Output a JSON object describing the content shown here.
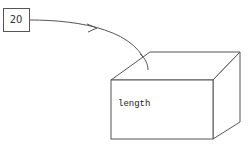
{
  "value_box": {
    "value": "20"
  },
  "variable_box": {
    "name": "length"
  },
  "colors": {
    "stroke": "#555555",
    "background": "#ffffff"
  }
}
